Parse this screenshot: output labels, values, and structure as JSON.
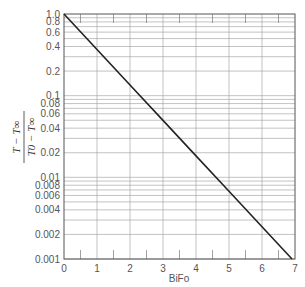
{
  "chart_data": {
    "type": "line",
    "title": "",
    "xlabel": "BiFo",
    "ylabel_numerator": "T − T∞",
    "ylabel_denominator": "T0 − T∞",
    "xlim": [
      0,
      7
    ],
    "ylim": [
      0.001,
      1.0
    ],
    "yscale": "log",
    "grid": true,
    "legend": "none",
    "x_ticks": [
      "0",
      "1",
      "2",
      "3",
      "4",
      "5",
      "6",
      "7"
    ],
    "y_ticks": [
      "1.0",
      "0.8",
      "0.6",
      "0.4",
      "0.2",
      "0.1",
      "0.08",
      "0.06",
      "0.04",
      "0.02",
      "0.01",
      "0.008",
      "0.006",
      "0.004",
      "0.002",
      "0.001"
    ],
    "y_tick_values": [
      1.0,
      0.8,
      0.6,
      0.4,
      0.2,
      0.1,
      0.08,
      0.06,
      0.04,
      0.02,
      0.01,
      0.008,
      0.006,
      0.004,
      0.002,
      0.001
    ],
    "series": [
      {
        "name": "exp(-BiFo)",
        "x": [
          0,
          1,
          2,
          3,
          4,
          5,
          6,
          6.91
        ],
        "y": [
          1.0,
          0.368,
          0.135,
          0.0498,
          0.0183,
          0.00674,
          0.00248,
          0.001
        ]
      }
    ]
  }
}
